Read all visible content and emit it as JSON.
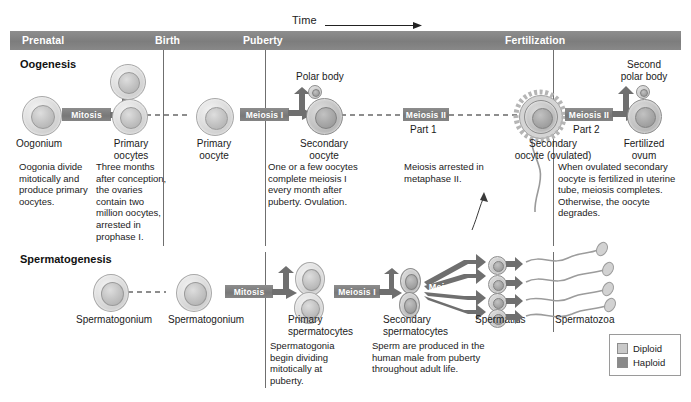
{
  "timeline": {
    "axis_label": "Time",
    "eras": [
      {
        "id": "prenatal",
        "label": "Prenatal",
        "x": 22
      },
      {
        "id": "birth",
        "label": "Birth",
        "x": 155
      },
      {
        "id": "puberty",
        "label": "Puberty",
        "x": 243
      },
      {
        "id": "fertilization",
        "label": "Fertilization",
        "x": 505
      }
    ]
  },
  "oogenesis": {
    "heading": "Oogenesis",
    "cells": [
      {
        "id": "oogonium",
        "label": "Oogonium"
      },
      {
        "id": "primary-oocytes",
        "label": "Primary\noocytes",
        "line1": "Primary",
        "line2": "oocytes"
      },
      {
        "id": "primary-oocyte",
        "label": "Primary\noocyte",
        "line1": "Primary",
        "line2": "oocyte"
      },
      {
        "id": "secondary-oocyte",
        "label": "Secondary\noocyte",
        "line1": "Secondary",
        "line2": "oocyte"
      },
      {
        "id": "secondary-oocyte-ovulated",
        "label": "Secondary\noocyte (ovulated)",
        "line1": "Secondary",
        "line2": "oocyte (ovulated)"
      },
      {
        "id": "fertilized-ovum",
        "label": "Fertilized\novum",
        "line1": "Fertilized",
        "line2": "ovum"
      }
    ],
    "polar_body": "Polar body",
    "second_polar_body_line1": "Second",
    "second_polar_body_line2": "polar body",
    "processes": [
      {
        "id": "mitosis",
        "label": "Mitosis",
        "part": ""
      },
      {
        "id": "meiosis-1",
        "label": "Meiosis I",
        "part": ""
      },
      {
        "id": "meiosis-2-part-1",
        "label": "Meiosis II",
        "part": "Part 1"
      },
      {
        "id": "meiosis-2-part-2",
        "label": "Meiosis II",
        "part": "Part 2"
      }
    ],
    "captions": [
      {
        "id": "cap-oogonia",
        "text": "Oogonia divide mitotically and produce primary oocytes."
      },
      {
        "id": "cap-three-months",
        "text": "Three months after conception, the ovaries contain two million oocytes, arrested in prophase I."
      },
      {
        "id": "cap-ovulation",
        "text": "One or a few oocytes complete meiosis I every month after puberty. Ovulation."
      },
      {
        "id": "cap-metaphase",
        "text": "Meiosis arrested in metaphase II."
      },
      {
        "id": "cap-fertilized",
        "text": "When ovulated secondary oocyte is fertilized in uterine tube, meiosis completes. Otherwise, the oocyte degrades."
      }
    ]
  },
  "spermatogenesis": {
    "heading": "Spermatogenesis",
    "cells": [
      {
        "id": "spermatogonium-1",
        "label": "Spermatogonium"
      },
      {
        "id": "spermatogonium-2",
        "label": "Spermatogonium"
      },
      {
        "id": "primary-spermatocytes",
        "line1": "Primary",
        "line2": "spermatocytes"
      },
      {
        "id": "secondary-spermatocytes",
        "line1": "Secondary",
        "line2": "spermatocytes"
      },
      {
        "id": "spermatids",
        "label": "Spermatids"
      },
      {
        "id": "spermatozoa",
        "label": "Spermatozoa"
      }
    ],
    "processes": [
      {
        "id": "mitosis",
        "label": "Mitosis"
      },
      {
        "id": "meiosis-1",
        "label": "Meiosis I"
      },
      {
        "id": "meiosis-2",
        "label": "Meiosis II"
      }
    ],
    "captions": [
      {
        "id": "cap-spermatogonia",
        "text": "Spermatogonia begin dividing mitotically at puberty."
      },
      {
        "id": "cap-sperm-produced",
        "text": "Sperm are produced in the human male from puberty throughout adult life."
      }
    ]
  },
  "legend": {
    "items": [
      {
        "id": "diploid",
        "label": "Diploid",
        "color": "#c9c9c9"
      },
      {
        "id": "haploid",
        "label": "Haploid",
        "color": "#8a8a8a"
      }
    ]
  }
}
